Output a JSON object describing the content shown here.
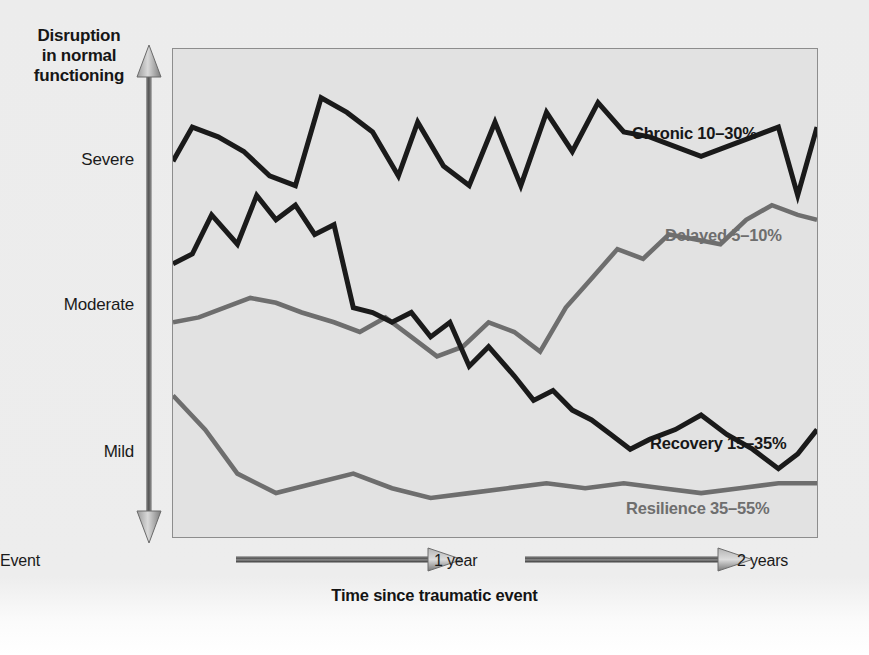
{
  "axes": {
    "y_title": "Disruption\nin normal\nfunctioning",
    "y_title_lines": [
      "Disruption",
      "in normal",
      "functioning"
    ],
    "y_ticks": [
      "Severe",
      "Moderate",
      "Mild"
    ],
    "x_title": "Time since traumatic event",
    "x_ticks": [
      "Event",
      "1 year",
      "2 years"
    ]
  },
  "labels": {
    "chronic": "Chronic 10–30%",
    "delayed": "Delayed 5–10%",
    "recovery": "Recovery 15–35%",
    "resilience": "Resilience 35–55%"
  },
  "colors": {
    "dark_line": "#1a1a1a",
    "grey_line": "#6e6e6e",
    "plot_bg": "#e2e2e2",
    "page_bg": "#ececec",
    "plot_border": "#8d8d8d"
  },
  "chart_data": {
    "type": "line",
    "title": "",
    "xlabel": "Time since traumatic event",
    "ylabel": "Disruption in normal functioning",
    "xticks": [
      "Event",
      "1 year",
      "2 years"
    ],
    "yticks": [
      "Mild",
      "Moderate",
      "Severe"
    ],
    "ylim": [
      0,
      100
    ],
    "grid": false,
    "legend": "inline-annotations",
    "note": "Bonanno trajectories of disruption after a potentially traumatic event. y values are percent of full-scale height where 100 = top of plot (most severe disruption). x values are percent of the 2-year span.",
    "series": [
      {
        "name": "Chronic 10–30%",
        "color": "#1a1a1a",
        "label_position": "upper-right",
        "x": [
          0,
          3,
          7,
          11,
          15,
          19,
          23,
          27,
          31,
          35,
          38,
          42,
          46,
          50,
          54,
          58,
          62,
          66,
          70,
          74,
          78,
          82,
          86,
          90,
          94,
          97,
          100
        ],
        "y": [
          77,
          84,
          82,
          79,
          74,
          72,
          90,
          87,
          83,
          74,
          85,
          76,
          72,
          85,
          72,
          87,
          79,
          89,
          83,
          82,
          80,
          78,
          80,
          82,
          84,
          70,
          84
        ]
      },
      {
        "name": "Delayed 5–10%",
        "color": "#6e6e6e",
        "label_position": "mid-right",
        "x": [
          0,
          4,
          8,
          12,
          16,
          20,
          25,
          29,
          33,
          37,
          41,
          45,
          49,
          53,
          57,
          61,
          65,
          69,
          73,
          77,
          81,
          85,
          89,
          93,
          97,
          100
        ],
        "y": [
          44,
          45,
          47,
          49,
          48,
          46,
          44,
          42,
          45,
          41,
          37,
          39,
          44,
          42,
          38,
          47,
          53,
          59,
          57,
          62,
          61,
          60,
          65,
          68,
          66,
          65
        ]
      },
      {
        "name": "Recovery 15–35%",
        "color": "#1a1a1a",
        "label_position": "lower-right",
        "x": [
          0,
          3,
          6,
          10,
          13,
          16,
          19,
          22,
          25,
          28,
          31,
          34,
          37,
          40,
          43,
          46,
          49,
          53,
          56,
          59,
          62,
          65,
          68,
          71,
          74,
          78,
          82,
          86,
          90,
          94,
          97,
          100
        ],
        "y": [
          56,
          58,
          66,
          60,
          70,
          65,
          68,
          62,
          64,
          47,
          46,
          44,
          46,
          41,
          44,
          35,
          39,
          33,
          28,
          30,
          26,
          24,
          21,
          18,
          20,
          22,
          25,
          21,
          18,
          14,
          17,
          22
        ]
      },
      {
        "name": "Resilience 35–55%",
        "color": "#6e6e6e",
        "label_position": "bottom-right",
        "x": [
          0,
          5,
          10,
          16,
          22,
          28,
          34,
          40,
          46,
          52,
          58,
          64,
          70,
          76,
          82,
          88,
          94,
          100
        ],
        "y": [
          29,
          22,
          13,
          9,
          11,
          13,
          10,
          8,
          9,
          10,
          11,
          10,
          11,
          10,
          9,
          10,
          11,
          11
        ]
      }
    ]
  }
}
